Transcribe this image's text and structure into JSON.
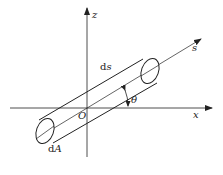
{
  "diagram": {
    "type": "cylinder-element-along-streamline",
    "axes": {
      "z_label": "z",
      "x_label": "x",
      "s_label": "s",
      "origin_label": "O"
    },
    "labels": {
      "length_element": "ds",
      "length_element_d": "d",
      "length_element_var": "s",
      "area_element_d": "d",
      "area_element_var": "A",
      "angle": "θ"
    },
    "colors": {
      "stroke": "#222222",
      "background": "#ffffff"
    }
  }
}
